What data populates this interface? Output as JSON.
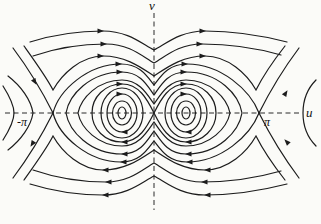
{
  "figure": {
    "background": "#fbfbf8",
    "ink": "#1c1c1c",
    "axis_labels": {
      "vertical": "v",
      "horizontal": "u",
      "left_tick": "-π",
      "right_tick": "π"
    },
    "flow_direction": "clockwise: rightward above the u-axis, leftward below"
  },
  "curves": [
    {
      "id": "open-top-1",
      "d": "M30,42 C62,32 86,31 103,31 C128,31 142,44 154,50 C166,44 180,31 205,31 C226,31 252,33 287,42"
    },
    {
      "id": "open-top-2",
      "d": "M33,56 C62,46 88,44 106,44 C130,44 143,57 154,63 C165,57 178,44 202,44 C224,44 253,47 281,55"
    },
    {
      "id": "open-top-3",
      "d": "M24,46 C34,60 47,78 53,90 C62,74 81,56 103,56 C127,56 143,69 154,76 C165,69 181,56 205,56 C228,56 247,74 256,90 C262,78 274,60 285,46"
    },
    {
      "id": "separatrix-upper",
      "d": "M53,113 C59,90 88,64 121,64 C140,64 147,76 154,85 C161,76 168,64 187,64 C221,64 250,90 259,113"
    },
    {
      "id": "separatrix-lower",
      "d": "M53,113 C59,136 88,162 121,162 C140,162 147,150 154,141 C161,150 168,162 187,162 C221,162 250,136 259,113"
    },
    {
      "id": "branch-left-up",
      "d": "M53,113 C44,95 28,68 13,48"
    },
    {
      "id": "branch-left-down",
      "d": "M53,113 C44,131 28,158 13,178"
    },
    {
      "id": "branch-right-up",
      "d": "M259,113 C268,95 284,68 299,48"
    },
    {
      "id": "branch-right-down",
      "d": "M259,113 C268,131 284,158 299,178"
    },
    {
      "id": "outer-closed-orbit",
      "d": "M66,113 C69,95 90,72 122,72 C140,72 147,85 154,95 C161,85 168,72 186,72 C219,72 239,95 242,113 C239,131 219,154 186,154 C168,154 161,141 154,131 C147,141 140,154 122,154 C90,154 69,131 66,113 Z"
    },
    {
      "id": "inner-closed-orbit",
      "d": "M78,113 C81,98 98,80 122,80 C139,80 147,94 154,104 C161,94 169,80 186,80 C210,80 227,98 230,113 C227,128 210,146 186,146 C169,146 161,132 154,122 C147,132 139,146 122,146 C98,146 81,128 78,113 Z"
    },
    {
      "id": "figure-eight-left-lobe",
      "d": "M154,113 C147,99 139,84 122,84 C105,84 92,97 92,113 C92,129 105,142 122,142 C139,142 147,127 154,113 Z"
    },
    {
      "id": "figure-eight-right-lobe",
      "d": "M154,113 C161,99 169,84 186,84 C203,84 216,97 216,113 C216,129 203,142 186,142 C169,142 161,127 154,113 Z"
    },
    {
      "id": "open-bottom-1",
      "d": "M30,184 C62,194 86,195 103,195 C128,195 142,182 154,176 C166,182 180,195 205,195 C226,195 252,193 287,184"
    },
    {
      "id": "open-bottom-2",
      "d": "M33,170 C62,180 88,182 106,182 C130,182 143,169 154,163 C165,169 178,182 202,182 C224,182 253,179 281,171"
    },
    {
      "id": "open-bottom-3",
      "d": "M24,180 C34,166 47,148 53,136 C62,152 81,170 103,170 C127,170 143,157 154,150 C165,157 181,170 205,170 C228,170 247,152 256,136 C262,148 274,166 285,180"
    },
    {
      "id": "adjacent-orbit-left-vertex",
      "d": "M8,76 C21,86 31,100 33,113 C31,126 21,140 8,150"
    },
    {
      "id": "adjacent-orbit-left-edge",
      "d": "M3,86 C10,97 14,105 14,113 C14,121 10,129 3,140"
    },
    {
      "id": "adjacent-orbit-right-vertex",
      "d": "M316,80 C306,90 303,102 303,113 C303,124 306,136 316,146"
    }
  ],
  "ovals": [
    {
      "cx": 122,
      "cy": 113,
      "rx": 4,
      "ry": 6
    },
    {
      "cx": 122,
      "cy": 113,
      "rx": 9.5,
      "ry": 12
    },
    {
      "cx": 122,
      "cy": 113,
      "rx": 15,
      "ry": 19
    },
    {
      "cx": 122,
      "cy": 113,
      "rx": 21,
      "ry": 25
    },
    {
      "cx": 186,
      "cy": 113,
      "rx": 4,
      "ry": 6
    },
    {
      "cx": 186,
      "cy": 113,
      "rx": 9.5,
      "ry": 12
    },
    {
      "cx": 186,
      "cy": 113,
      "rx": 15,
      "ry": 19
    },
    {
      "cx": 186,
      "cy": 113,
      "rx": 21,
      "ry": 25
    }
  ],
  "arrows": [
    {
      "x": 103,
      "y": 31,
      "a": 0
    },
    {
      "x": 205,
      "y": 31,
      "a": 0
    },
    {
      "x": 106,
      "y": 44,
      "a": 0
    },
    {
      "x": 202,
      "y": 44,
      "a": 0
    },
    {
      "x": 103,
      "y": 56,
      "a": 0
    },
    {
      "x": 205,
      "y": 56,
      "a": 0
    },
    {
      "x": 121,
      "y": 64,
      "a": 0
    },
    {
      "x": 187,
      "y": 64,
      "a": 0
    },
    {
      "x": 122,
      "y": 72,
      "a": 0
    },
    {
      "x": 186,
      "y": 72,
      "a": 0
    },
    {
      "x": 122,
      "y": 84,
      "a": 0
    },
    {
      "x": 186,
      "y": 84,
      "a": 0
    },
    {
      "x": 122,
      "y": 94,
      "a": 0
    },
    {
      "x": 186,
      "y": 94,
      "a": 0
    },
    {
      "x": 103,
      "y": 195,
      "a": 180
    },
    {
      "x": 205,
      "y": 195,
      "a": 180
    },
    {
      "x": 106,
      "y": 182,
      "a": 180
    },
    {
      "x": 202,
      "y": 182,
      "a": 180
    },
    {
      "x": 103,
      "y": 170,
      "a": 180
    },
    {
      "x": 205,
      "y": 170,
      "a": 180
    },
    {
      "x": 121,
      "y": 162,
      "a": 180
    },
    {
      "x": 187,
      "y": 162,
      "a": 180
    },
    {
      "x": 122,
      "y": 154,
      "a": 180
    },
    {
      "x": 186,
      "y": 154,
      "a": 180
    },
    {
      "x": 122,
      "y": 142,
      "a": 180
    },
    {
      "x": 186,
      "y": 142,
      "a": 180
    },
    {
      "x": 122,
      "y": 132,
      "a": 180
    },
    {
      "x": 186,
      "y": 132,
      "a": 180
    },
    {
      "x": 36,
      "y": 84,
      "a": 60
    },
    {
      "x": 31,
      "y": 146,
      "a": 122
    },
    {
      "x": 287,
      "y": 91,
      "a": -58
    },
    {
      "x": 285,
      "y": 140,
      "a": 226
    }
  ]
}
